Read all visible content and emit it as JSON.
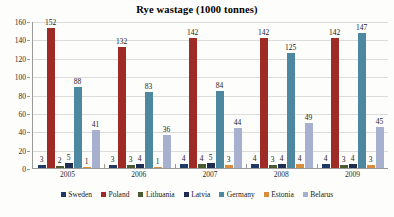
{
  "chart_data": {
    "type": "bar",
    "title": "Rye wastage (1000 tonnes)",
    "xlabel": "",
    "ylabel": "",
    "ylim": [
      0,
      160
    ],
    "yticks": [
      0,
      20,
      40,
      60,
      80,
      100,
      120,
      140,
      160
    ],
    "grid": true,
    "legend_position": "bottom",
    "categories": [
      "2005",
      "2006",
      "2007",
      "2008",
      "2009"
    ],
    "series": [
      {
        "name": "Sweden",
        "color": "#1f3864",
        "values": [
          3,
          3,
          4,
          4,
          4
        ]
      },
      {
        "name": "Poland",
        "color": "#9e2b25",
        "values": [
          152,
          132,
          142,
          142,
          142
        ]
      },
      {
        "name": "Lithuania",
        "color": "#4a5b32",
        "values": [
          2,
          3,
          4,
          3,
          3
        ]
      },
      {
        "name": "Latvia",
        "color": "#1f2d52",
        "values": [
          5,
          4,
          5,
          4,
          4
        ]
      },
      {
        "name": "Germany",
        "color": "#4e87a0",
        "values": [
          88,
          83,
          84,
          125,
          147
        ]
      },
      {
        "name": "Estonia",
        "color": "#d98b3e",
        "values": [
          1,
          1,
          3,
          4,
          3
        ]
      },
      {
        "name": "Belarus",
        "color": "#a7b1cf",
        "values": [
          41,
          36,
          44,
          49,
          45
        ]
      }
    ]
  }
}
